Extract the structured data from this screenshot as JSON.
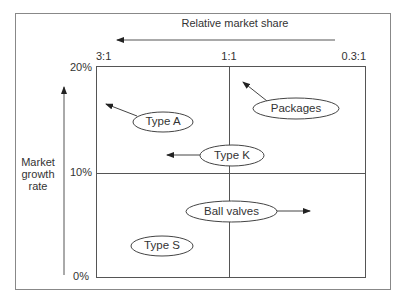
{
  "diagram": {
    "title_axis_x": "Relative market share",
    "axis_y_label_lines": [
      "Market",
      "growth",
      "rate"
    ],
    "x_ticks": [
      "3:1",
      "1:1",
      "0.3:1"
    ],
    "y_ticks": [
      "20%",
      "10%",
      "0%"
    ],
    "items": [
      {
        "label": "Type A",
        "arrow_direction": "up-left"
      },
      {
        "label": "Packages",
        "arrow_direction": "up-left"
      },
      {
        "label": "Type K",
        "arrow_direction": "left"
      },
      {
        "label": "Ball valves",
        "arrow_direction": "right"
      },
      {
        "label": "Type S",
        "arrow_direction": "none"
      }
    ],
    "colors": {
      "line": "#555555",
      "text": "#333333",
      "frame": "#888888"
    }
  }
}
